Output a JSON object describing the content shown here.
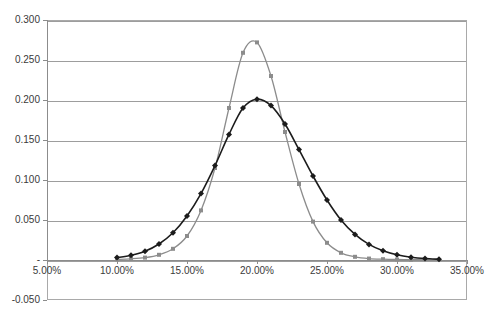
{
  "chart_data": {
    "type": "line",
    "title": "",
    "subtitle": "",
    "xlabel": "",
    "ylabel": "",
    "xlim": [
      5,
      35
    ],
    "ylim": [
      -0.05,
      0.3
    ],
    "grid": true,
    "legend": "none",
    "x_tick_labels": [
      "5.00%",
      "10.00%",
      "15.00%",
      "20.00%",
      "25.00%",
      "30.00%",
      "35.00%"
    ],
    "x_ticks": [
      5,
      10,
      15,
      20,
      25,
      30,
      35
    ],
    "y_tick_labels": [
      "0.300",
      "0.250",
      "0.200",
      "0.150",
      "0.100",
      "0.050",
      "-",
      "-0.050"
    ],
    "y_ticks": [
      0.3,
      0.25,
      0.2,
      0.15,
      0.1,
      0.05,
      0.0,
      -0.05
    ],
    "zero_tick_label": "-",
    "x": [
      10,
      11,
      12,
      13,
      14,
      15,
      16,
      17,
      18,
      19,
      20,
      21,
      22,
      23,
      24,
      25,
      26,
      27,
      28,
      29,
      30,
      31,
      32,
      33
    ],
    "series": [
      {
        "name": "series-dark",
        "color": "#1c1c1c",
        "marker": "diamond",
        "marker_size": 3,
        "line_width": 1.6,
        "values": [
          0.003,
          0.006,
          0.011,
          0.02,
          0.034,
          0.055,
          0.083,
          0.118,
          0.157,
          0.19,
          0.201,
          0.193,
          0.17,
          0.138,
          0.105,
          0.075,
          0.05,
          0.032,
          0.0195,
          0.0115,
          0.0065,
          0.0035,
          0.0018,
          0.001
        ]
      },
      {
        "name": "series-gray",
        "color": "#8c8c8c",
        "marker": "square",
        "marker_size": 4,
        "line_width": 1.3,
        "values": [
          0.0008,
          0.0015,
          0.003,
          0.0065,
          0.014,
          0.03,
          0.062,
          0.115,
          0.19,
          0.259,
          0.272,
          0.23,
          0.16,
          0.095,
          0.048,
          0.0215,
          0.009,
          0.004,
          0.0018,
          0.001,
          0.0006,
          0.0004,
          0.0003,
          0.0002
        ]
      }
    ]
  },
  "colors": {
    "plot_border": "#a9a9a9",
    "gridline": "#9d9d9d",
    "axis": "#8c8c8c",
    "text": "#3a3a3a",
    "background": "#ffffff",
    "series_dark": "#1c1c1c",
    "series_gray": "#8c8c8c"
  }
}
